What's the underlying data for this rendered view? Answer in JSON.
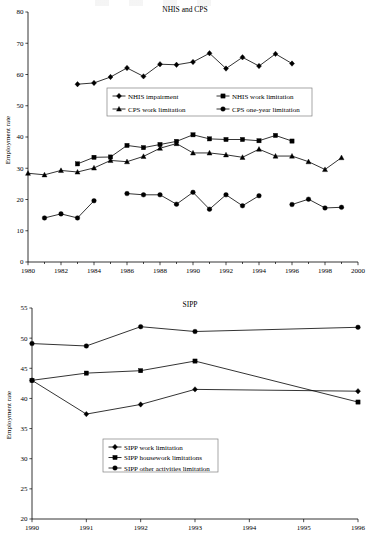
{
  "page": {
    "background": "#ffffff",
    "ink": "#000000",
    "legend_border": "#808080"
  },
  "chart_data": [
    {
      "id": "nhis-cps",
      "type": "line",
      "title": "NHIS and CPS",
      "xlabel": "",
      "ylabel": "Employment rate",
      "xlim": [
        1980,
        2000
      ],
      "ylim": [
        0,
        80
      ],
      "ytick_step": 10,
      "yticks": [
        0,
        10,
        20,
        30,
        40,
        50,
        60,
        70,
        80
      ],
      "xticks": [
        1980,
        1982,
        1984,
        1986,
        1988,
        1990,
        1992,
        1994,
        1996,
        1998,
        2000
      ],
      "xtick_minor_step": 1,
      "grid": false,
      "legend_position": "center",
      "series": [
        {
          "name": "NHIS impairment",
          "marker": "diamond",
          "x": [
            1983,
            1984,
            1985,
            1986,
            1987,
            1988,
            1989,
            1990,
            1991,
            1992,
            1993,
            1994,
            1995,
            1996
          ],
          "values": [
            56.9,
            57.3,
            59.2,
            62.1,
            59.4,
            63.3,
            63.1,
            64.0,
            66.8,
            61.9,
            65.5,
            62.7,
            66.6,
            63.5
          ]
        },
        {
          "name": "NHIS work limitation",
          "marker": "square",
          "x": [
            1983,
            1984,
            1985,
            1986,
            1987,
            1988,
            1989,
            1990,
            1991,
            1992,
            1993,
            1994,
            1995,
            1996
          ],
          "values": [
            31.4,
            33.5,
            33.6,
            37.3,
            36.6,
            37.6,
            38.6,
            40.7,
            39.4,
            39.2,
            39.2,
            38.8,
            40.5,
            38.7
          ]
        },
        {
          "name": "CPS work limitation",
          "marker": "triangle",
          "x": [
            1980,
            1981,
            1982,
            1983,
            1984,
            1985,
            1986,
            1987,
            1988,
            1989,
            1990,
            1991,
            1992,
            1993,
            1994,
            1995,
            1996,
            1997,
            1998,
            1999
          ],
          "values": [
            28.4,
            27.9,
            29.3,
            28.8,
            30.1,
            32.5,
            32.1,
            33.8,
            36.4,
            37.9,
            34.9,
            34.9,
            34.3,
            33.5,
            36.1,
            33.9,
            33.9,
            32.1,
            29.6,
            33.4
          ]
        },
        {
          "name": "CPS one-year limitation",
          "marker": "circle",
          "segments": [
            {
              "x": [
                1981,
                1982,
                1983,
                1984
              ],
              "values": [
                14.1,
                15.4,
                14.1,
                19.6
              ]
            },
            {
              "x": [
                1986,
                1987,
                1988,
                1989,
                1990,
                1991,
                1992,
                1993,
                1994
              ],
              "values": [
                21.9,
                21.5,
                21.5,
                18.5,
                22.3,
                16.9,
                21.5,
                18.0,
                21.2
              ]
            },
            {
              "x": [
                1996,
                1997,
                1998,
                1999
              ],
              "values": [
                18.4,
                20.1,
                17.3,
                17.5
              ]
            }
          ]
        }
      ]
    },
    {
      "id": "sipp",
      "type": "line",
      "title": "SIPP",
      "xlabel": "",
      "ylabel": "Employment rate",
      "xlim": [
        1990,
        1996
      ],
      "ylim": [
        20,
        55
      ],
      "ytick_step": 5,
      "yticks": [
        20,
        25,
        30,
        35,
        40,
        45,
        50,
        55
      ],
      "xticks": [
        1990,
        1991,
        1992,
        1993,
        1994,
        1995,
        1996
      ],
      "xtick_minor_step": 1,
      "grid": false,
      "legend_position": "lower-center",
      "series": [
        {
          "name": "SIPP work limitation",
          "marker": "diamond",
          "x": [
            1990,
            1991,
            1992,
            1993,
            1996
          ],
          "values": [
            43.0,
            37.4,
            39.0,
            41.5,
            41.2
          ]
        },
        {
          "name": "SIPP housework limitations",
          "marker": "square",
          "x": [
            1990,
            1991,
            1992,
            1993,
            1996
          ],
          "values": [
            43.0,
            44.2,
            44.6,
            46.2,
            39.4
          ]
        },
        {
          "name": "SIPP other activities limitation",
          "marker": "circle",
          "x": [
            1990,
            1991,
            1992,
            1993,
            1996
          ],
          "values": [
            49.1,
            48.7,
            51.9,
            51.1,
            51.8
          ]
        }
      ]
    }
  ]
}
